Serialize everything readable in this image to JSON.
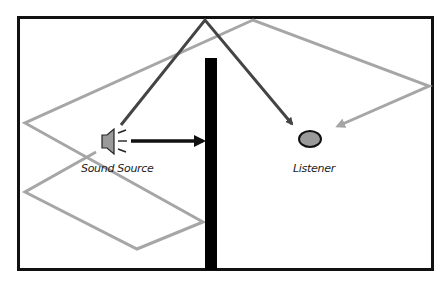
{
  "diagram": {
    "labels": {
      "source": "Sound Source",
      "listener": "Listener"
    },
    "colors": {
      "frame": "#111111",
      "wall": "#000000",
      "direct_arrow": "#111111",
      "first_reflection": "#444444",
      "multi_reflection": "#a6a6a6",
      "speaker_fill": "#9a9a9a",
      "listener_fill": "#9a9a9a"
    },
    "elements": [
      {
        "id": "room",
        "type": "rectangle"
      },
      {
        "id": "wall",
        "type": "barrier"
      },
      {
        "id": "sound-source",
        "type": "speaker"
      },
      {
        "id": "listener",
        "type": "circle"
      },
      {
        "id": "direct-path",
        "type": "arrow",
        "blocked_by": "wall"
      },
      {
        "id": "ceiling-reflection",
        "type": "arrow",
        "from": "sound-source",
        "to": "listener"
      },
      {
        "id": "multiple-reflection",
        "type": "arrow",
        "from": "sound-source",
        "to": "listener"
      }
    ]
  }
}
